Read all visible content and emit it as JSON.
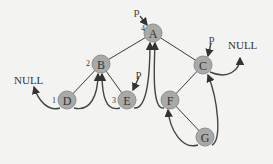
{
  "diagram": {
    "type": "threaded-binary-tree",
    "nodes": [
      {
        "id": "A",
        "label": "A",
        "order": "4",
        "pointer": "p"
      },
      {
        "id": "B",
        "label": "B",
        "order": "2"
      },
      {
        "id": "C",
        "label": "C",
        "pointer": "p"
      },
      {
        "id": "D",
        "label": "D",
        "order": "1"
      },
      {
        "id": "E",
        "label": "E",
        "order": "3",
        "pointer": "p"
      },
      {
        "id": "F",
        "label": "F"
      },
      {
        "id": "G",
        "label": "G"
      }
    ],
    "edges": [
      [
        "A",
        "B"
      ],
      [
        "A",
        "C"
      ],
      [
        "B",
        "D"
      ],
      [
        "B",
        "E"
      ],
      [
        "C",
        "F"
      ],
      [
        "F",
        "G"
      ]
    ],
    "threads": [
      {
        "from": "D",
        "to": "NULL-left"
      },
      {
        "from": "D",
        "to": "B"
      },
      {
        "from": "E",
        "to": "B"
      },
      {
        "from": "E",
        "to": "A"
      },
      {
        "from": "F",
        "to": "A"
      },
      {
        "from": "G",
        "to": "F"
      },
      {
        "from": "G",
        "to": "C"
      },
      {
        "from": "C",
        "to": "NULL-right"
      }
    ],
    "null_left": "NULL",
    "null_right": "NULL",
    "pointer_label": "p"
  }
}
